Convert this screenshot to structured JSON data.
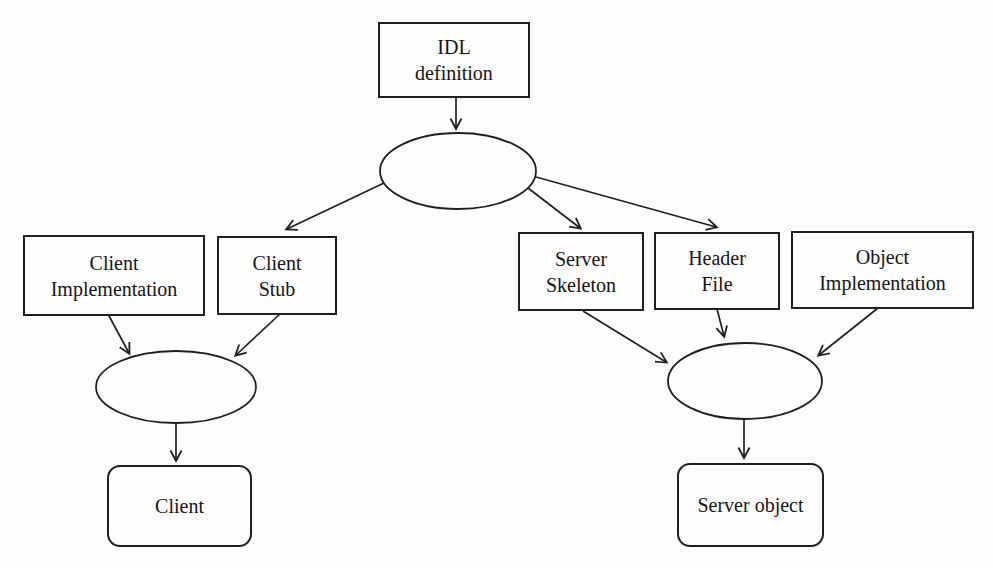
{
  "figure": {
    "type": "flow-diagram",
    "colors": {
      "line": "#1f1f1f",
      "text": "#141414",
      "background": "#fefefe"
    },
    "nodes": {
      "idl_definition": {
        "shape": "rectangle",
        "lines": [
          "IDL",
          "definition"
        ]
      },
      "ellipse_top": {
        "shape": "ellipse",
        "lines": []
      },
      "client_implementation": {
        "shape": "rectangle",
        "lines": [
          "Client",
          "Implementation"
        ]
      },
      "client_stub": {
        "shape": "rectangle",
        "lines": [
          "Client",
          "Stub"
        ]
      },
      "server_skeleton": {
        "shape": "rectangle",
        "lines": [
          "Server",
          "Skeleton"
        ]
      },
      "header_file": {
        "shape": "rectangle",
        "lines": [
          "Header",
          "File"
        ]
      },
      "object_implementation": {
        "shape": "rectangle",
        "lines": [
          "Object",
          "Implementation"
        ]
      },
      "ellipse_left": {
        "shape": "ellipse",
        "lines": []
      },
      "ellipse_right": {
        "shape": "ellipse",
        "lines": []
      },
      "client": {
        "shape": "rounded-rectangle",
        "lines": [
          "Client"
        ]
      },
      "server_object": {
        "shape": "rounded-rectangle",
        "lines": [
          "Server object"
        ]
      }
    },
    "edges": [
      {
        "from": "idl_definition",
        "to": "ellipse_top"
      },
      {
        "from": "ellipse_top",
        "to": "client_stub"
      },
      {
        "from": "ellipse_top",
        "to": "server_skeleton"
      },
      {
        "from": "ellipse_top",
        "to": "header_file"
      },
      {
        "from": "client_implementation",
        "to": "ellipse_left"
      },
      {
        "from": "client_stub",
        "to": "ellipse_left"
      },
      {
        "from": "ellipse_left",
        "to": "client"
      },
      {
        "from": "server_skeleton",
        "to": "ellipse_right"
      },
      {
        "from": "header_file",
        "to": "ellipse_right"
      },
      {
        "from": "object_implementation",
        "to": "ellipse_right"
      },
      {
        "from": "ellipse_right",
        "to": "server_object"
      }
    ]
  }
}
